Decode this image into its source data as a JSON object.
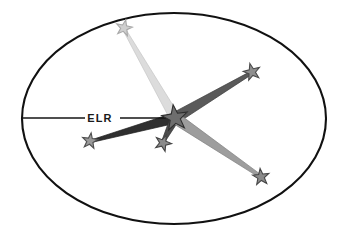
{
  "figure": {
    "background_color": "#ffffff",
    "boundary": {
      "shape": "ellipse",
      "name": "outer-ellipse",
      "cx": 174,
      "cy": 118.5,
      "rx": 152,
      "ry": 105.5,
      "stroke_color": "#111111",
      "stroke_width": 2.1,
      "fill": "none"
    },
    "labels": {
      "elr": "ELR"
    },
    "elr_axis": {
      "name": "elr-axis-line",
      "from_x": 23,
      "from_y": 118,
      "to_x": 176,
      "to_y": 118,
      "color": "#141414",
      "width": 1.6,
      "label_x": 100,
      "label_y": 122,
      "label_gap_start": 85,
      "label_gap_end": 120
    },
    "hub": {
      "name": "center-hub-star",
      "x": 175,
      "y": 118,
      "radius": 13.5,
      "fill": "#6e6e6e",
      "stroke": "#2e2e2e",
      "rotation": -8
    },
    "rays": [
      {
        "id": "ray-top",
        "name": "ray-to-star-top",
        "target_x": 124,
        "target_y": 29,
        "color": "#dcdcdc",
        "stroke": "#c6c6c6",
        "base_half_width": 5.0,
        "tip_half_width": 1.4,
        "style": "light-wedge"
      },
      {
        "id": "ray-upper-right",
        "name": "ray-to-star-upper-right",
        "target_x": 251,
        "target_y": 73,
        "color": "#5a5a5a",
        "stroke": "#3c3c3c",
        "base_half_width": 5.6,
        "tip_half_width": 1.6,
        "style": "dark-wedge"
      },
      {
        "id": "ray-lower-left",
        "name": "ray-to-star-lower-left",
        "target_x": 92,
        "target_y": 141,
        "color": "#2f2f2f",
        "stroke": "#1c1c1c",
        "base_half_width": 5.2,
        "tip_half_width": 1.3,
        "style": "darkest-wedge"
      },
      {
        "id": "ray-lower-middle",
        "name": "ray-to-star-lower-middle",
        "target_x": 163,
        "target_y": 142,
        "color": "#4d4d4d",
        "stroke": "#303030",
        "base_half_width": 4.6,
        "tip_half_width": 1.5,
        "style": "dark-wedge"
      },
      {
        "id": "ray-bottom-right",
        "name": "ray-to-star-bottom-right",
        "target_x": 260,
        "target_y": 176,
        "color": "#9d9d9d",
        "stroke": "#7f7f7f",
        "base_half_width": 5.6,
        "tip_half_width": 1.6,
        "style": "mid-wedge"
      }
    ],
    "stars": [
      {
        "id": "star-top",
        "name": "star-node-top",
        "x": 124,
        "y": 28,
        "radius": 8.4,
        "fill": "#cfcfcf",
        "stroke": "#a8a8a8",
        "rotation": 12
      },
      {
        "id": "star-upper-right",
        "name": "star-node-upper-right",
        "x": 252,
        "y": 72,
        "radius": 8.8,
        "fill": "#8e8e8e",
        "stroke": "#4a4a4a",
        "rotation": -14
      },
      {
        "id": "star-lower-left",
        "name": "star-node-lower-left",
        "x": 90,
        "y": 141,
        "radius": 8.2,
        "fill": "#9a9a9a",
        "stroke": "#4f4f4f",
        "rotation": 8
      },
      {
        "id": "star-lower-middle",
        "name": "star-node-lower-middle",
        "x": 163,
        "y": 143,
        "radius": 8.6,
        "fill": "#8b8b8b",
        "stroke": "#454545",
        "rotation": 22
      },
      {
        "id": "star-bottom-right",
        "name": "star-node-bottom-right",
        "x": 261,
        "y": 177,
        "radius": 8.6,
        "fill": "#8a8a8a",
        "stroke": "#464646",
        "rotation": -6
      }
    ],
    "colors": {
      "ink": "#111111",
      "paper": "#ffffff",
      "ray_light": "#dcdcdc",
      "ray_mid": "#9d9d9d",
      "ray_dark": "#5a5a5a",
      "ray_darkest": "#2f2f2f"
    }
  }
}
